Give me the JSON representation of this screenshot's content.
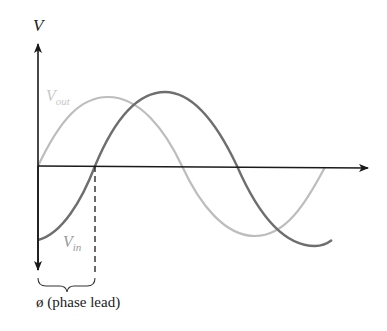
{
  "diagram": {
    "y_axis_label": "V",
    "curves": [
      {
        "name": "V_out",
        "label_main": "V",
        "label_sub": "out",
        "color": "#bdbdbd"
      },
      {
        "name": "V_in",
        "label_main": "V",
        "label_sub": "in",
        "color": "#6e6e6e"
      }
    ],
    "phase_label": "ø (phase lead)",
    "colors": {
      "axis": "#1a1a1a",
      "vout": "#bdbdbd",
      "vin": "#6e6e6e",
      "text": "#222222",
      "vout_label": "#c8c8c8",
      "vin_label": "#9a9a9a"
    }
  }
}
